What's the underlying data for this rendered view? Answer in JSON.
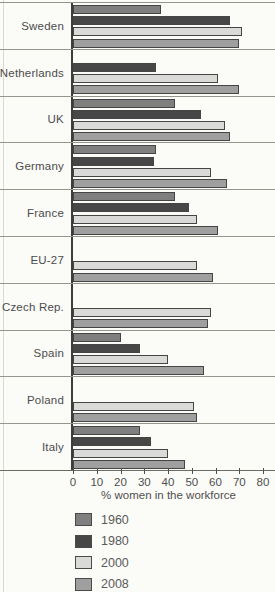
{
  "chart_data": {
    "type": "bar",
    "orientation": "horizontal",
    "xlabel": "% women in the workforce",
    "xlim": [
      0,
      80
    ],
    "xticks": [
      0,
      10,
      20,
      30,
      40,
      50,
      60,
      70,
      80
    ],
    "grid": "row-separator-lines",
    "legend_position": "bottom-left",
    "categories": [
      "Sweden",
      "Netherlands",
      "UK",
      "Germany",
      "France",
      "EU-27",
      "Czech Rep.",
      "Spain",
      "Poland",
      "Italy"
    ],
    "series": [
      {
        "name": "1960",
        "color": "#7f7f7f",
        "values": [
          37,
          null,
          43,
          35,
          43,
          null,
          null,
          20,
          null,
          28
        ]
      },
      {
        "name": "1980",
        "color": "#474747",
        "values": [
          66,
          35,
          54,
          34,
          49,
          null,
          null,
          28,
          null,
          33
        ]
      },
      {
        "name": "2000",
        "color": "#dadad8",
        "values": [
          71,
          61,
          64,
          58,
          52,
          52,
          58,
          40,
          51,
          40
        ]
      },
      {
        "name": "2008",
        "color": "#9f9f9f",
        "values": [
          70,
          70,
          66,
          65,
          61,
          59,
          57,
          55,
          52,
          47
        ]
      }
    ]
  },
  "colors": {
    "axis_line": "#3c3c3c",
    "separator_line": "#95958d",
    "bar_outline": "#454545",
    "background": "#fbfbf8"
  }
}
